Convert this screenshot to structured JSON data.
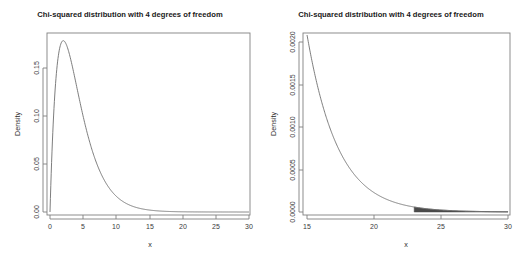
{
  "figure": {
    "background_color": "#ffffff",
    "panel_count": 2
  },
  "panels": {
    "left": {
      "title": "Chi-squared distribution with 4 degrees of freedom",
      "xlabel": "x",
      "ylabel": "Density",
      "xticks": [
        "0",
        "5",
        "10",
        "15",
        "20",
        "25",
        "30"
      ],
      "yticks": [
        "0.00",
        "0.05",
        "0.10",
        "0.15"
      ]
    },
    "right": {
      "title": "Chi-squared distribution with 4 degrees of freedom",
      "xlabel": "x",
      "ylabel": "Density",
      "xticks": [
        "15",
        "20",
        "25",
        "30"
      ],
      "yticks": [
        "0.0000",
        "0.0005",
        "0.0010",
        "0.0015",
        "0.0020"
      ]
    }
  },
  "chart_data": [
    {
      "type": "line",
      "title": "Chi-squared distribution with 4 degrees of freedom",
      "xlabel": "x",
      "ylabel": "Density",
      "xlim": [
        0,
        30
      ],
      "ylim": [
        0,
        0.19
      ],
      "xticks": [
        0,
        5,
        10,
        15,
        20,
        25,
        30
      ],
      "yticks": [
        0.0,
        0.05,
        0.1,
        0.15
      ],
      "grid": false,
      "legend": "none",
      "line_color": "#6e6e6e",
      "series": [
        {
          "name": "chi-squared df=4 density",
          "x": [
            0.0,
            0.5,
            1.0,
            1.5,
            2.0,
            2.5,
            3.0,
            3.5,
            4.0,
            4.5,
            5.0,
            6.0,
            7.0,
            8.0,
            9.0,
            10.0,
            11.0,
            12.0,
            13.0,
            14.0,
            15.0,
            16.0,
            17.0,
            18.0,
            20.0,
            22.0,
            24.0,
            26.0,
            28.0,
            30.0
          ],
          "y": [
            0.0,
            0.0973,
            0.1516,
            0.1771,
            0.1839,
            0.1791,
            0.1673,
            0.1516,
            0.1353,
            0.1186,
            0.1026,
            0.0747,
            0.0528,
            0.0366,
            0.025,
            0.0168,
            0.0112,
            0.0074,
            0.0048,
            0.0031,
            0.002,
            0.0013,
            0.0008,
            0.0005,
            0.0002,
            0.0001,
            0.0,
            0.0,
            0.0,
            0.0
          ]
        }
      ],
      "annotations": []
    },
    {
      "type": "area",
      "title": "Chi-squared distribution with 4 degrees of freedom",
      "xlabel": "x",
      "ylabel": "Density",
      "xlim": [
        15,
        30
      ],
      "ylim": [
        0,
        0.00207
      ],
      "xticks": [
        15,
        20,
        25,
        30
      ],
      "yticks": [
        0.0,
        0.0005,
        0.001,
        0.0015,
        0.002
      ],
      "grid": false,
      "legend": "none",
      "line_color": "#6e6e6e",
      "shaded_region": {
        "fill_color": "#4a4a4a",
        "x_start": 23,
        "x_end": 30,
        "description": "upper tail critical region"
      },
      "series": [
        {
          "name": "chi-squared df=4 density (tail)",
          "x": [
            15.0,
            15.5,
            16.0,
            16.5,
            17.0,
            17.5,
            18.0,
            18.5,
            19.0,
            19.5,
            20.0,
            21.0,
            22.0,
            23.0,
            24.0,
            25.0,
            26.0,
            27.0,
            28.0,
            29.0,
            30.0
          ],
          "y": [
            0.002076,
            0.001745,
            0.001468,
            0.001234,
            0.001037,
            0.000871,
            0.000731,
            0.000613,
            0.000514,
            0.000431,
            0.000361,
            0.000253,
            0.000177,
            0.000124,
            8.66e-05,
            6.04e-05,
            4.21e-05,
            2.93e-05,
            2.04e-05,
            1.42e-05,
            9.9e-06
          ]
        }
      ],
      "annotations": []
    }
  ]
}
